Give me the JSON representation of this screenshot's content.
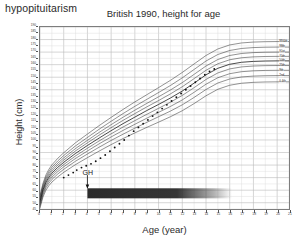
{
  "figure": {
    "corner_label": "hypopituitarism",
    "title": "British 1990, height for age"
  },
  "chart_data": {
    "type": "line",
    "title": "British 1990, height for age",
    "xlabel": "Age (year)",
    "ylabel": "Height (cm)",
    "xlim": [
      0,
      21
    ],
    "ylim": [
      45,
      190
    ],
    "grid": true,
    "legend_position": "right-inline-curve-labels",
    "xticks": [
      0,
      1,
      2,
      3,
      4,
      5,
      6,
      7,
      8,
      9,
      10,
      11,
      12,
      13,
      14,
      15,
      16,
      17,
      18,
      19,
      20,
      21
    ],
    "yticks": [
      45,
      50,
      55,
      60,
      65,
      70,
      75,
      80,
      85,
      90,
      95,
      100,
      105,
      110,
      115,
      120,
      125,
      130,
      135,
      140,
      145,
      150,
      155,
      160,
      165,
      170,
      175,
      180,
      185,
      190
    ],
    "ytick_labels": [
      "45",
      "50",
      "55",
      "60",
      "65",
      "70",
      "75",
      "80",
      "85",
      "90",
      "95",
      "100",
      "105",
      "110",
      "115",
      "120",
      "125",
      "130",
      "135",
      "140",
      "145",
      "150",
      "155",
      "160",
      "165",
      "170",
      "175",
      "180",
      "185",
      "190"
    ],
    "x": [
      0,
      0.25,
      0.5,
      0.75,
      1,
      1.5,
      2,
      3,
      4,
      5,
      6,
      7,
      8,
      9,
      10,
      11,
      12,
      13,
      14,
      15,
      16,
      17,
      18,
      19,
      20,
      21
    ],
    "series": [
      {
        "name": "0.4th",
        "label": "0.4th",
        "values": [
          45.8,
          54.5,
          60.0,
          63.6,
          66.4,
          70.6,
          74.2,
          80.4,
          85.9,
          91.2,
          96.3,
          101.1,
          105.6,
          110.0,
          114.2,
          118.5,
          123.3,
          129.0,
          135.2,
          140.4,
          143.6,
          145.2,
          145.9,
          146.2,
          146.3,
          146.3
        ]
      },
      {
        "name": "2nd",
        "label": "2nd",
        "values": [
          47.3,
          56.2,
          61.9,
          65.6,
          68.5,
          72.9,
          76.6,
          83.1,
          88.8,
          94.3,
          99.6,
          104.6,
          109.4,
          114.0,
          118.5,
          123.0,
          128.0,
          133.9,
          140.2,
          145.4,
          148.6,
          150.2,
          150.9,
          151.2,
          151.3,
          151.3
        ]
      },
      {
        "name": "9th",
        "label": "9th",
        "values": [
          48.6,
          57.7,
          63.5,
          67.3,
          70.3,
          74.8,
          78.6,
          85.3,
          91.2,
          97.0,
          102.4,
          107.6,
          112.5,
          117.3,
          122.0,
          126.7,
          131.9,
          138.0,
          144.4,
          149.6,
          152.8,
          154.4,
          155.1,
          155.4,
          155.5,
          155.5
        ]
      },
      {
        "name": "25th",
        "label": "25th",
        "values": [
          49.8,
          59.0,
          64.9,
          68.8,
          71.9,
          76.5,
          80.4,
          87.3,
          93.4,
          99.3,
          104.9,
          110.3,
          115.4,
          120.4,
          125.2,
          130.1,
          135.5,
          141.7,
          148.2,
          153.4,
          156.6,
          158.2,
          158.9,
          159.2,
          159.3,
          159.3
        ]
      },
      {
        "name": "50th",
        "label": "50th",
        "values": [
          51.0,
          60.2,
          66.3,
          70.3,
          73.5,
          78.2,
          82.2,
          89.3,
          95.6,
          101.6,
          107.4,
          113.0,
          118.2,
          123.4,
          128.3,
          133.4,
          139.0,
          145.3,
          151.9,
          157.1,
          160.3,
          161.9,
          162.6,
          162.9,
          163.0,
          163.0
        ]
      },
      {
        "name": "75th",
        "label": "75th",
        "values": [
          52.2,
          61.4,
          67.6,
          71.8,
          75.0,
          79.9,
          84.0,
          91.3,
          97.7,
          103.9,
          109.8,
          115.6,
          121.0,
          126.3,
          131.4,
          136.7,
          142.4,
          148.9,
          155.5,
          160.7,
          163.9,
          165.5,
          166.2,
          166.5,
          166.6,
          166.6
        ]
      },
      {
        "name": "91st",
        "label": "91st",
        "values": [
          53.3,
          62.6,
          68.9,
          73.2,
          76.5,
          81.5,
          85.7,
          93.2,
          99.7,
          106.1,
          112.2,
          118.1,
          123.7,
          129.1,
          134.4,
          139.8,
          145.7,
          152.3,
          158.9,
          164.1,
          167.3,
          168.9,
          169.6,
          169.9,
          170.0,
          170.0
        ]
      },
      {
        "name": "98th",
        "label": "98th",
        "values": [
          54.6,
          63.9,
          70.4,
          74.8,
          78.2,
          83.3,
          87.6,
          95.3,
          102.0,
          108.6,
          114.9,
          121.0,
          126.8,
          132.3,
          137.8,
          143.4,
          149.5,
          156.2,
          162.9,
          168.1,
          171.3,
          172.9,
          173.6,
          173.9,
          174.0,
          174.0
        ]
      },
      {
        "name": "99.6th",
        "label": "99.6th",
        "values": [
          56.0,
          65.4,
          72.1,
          76.6,
          80.1,
          85.4,
          89.8,
          97.8,
          104.7,
          111.5,
          118.0,
          124.3,
          130.3,
          136.0,
          141.7,
          147.5,
          153.8,
          160.6,
          167.3,
          172.5,
          175.7,
          177.3,
          178.0,
          178.3,
          178.4,
          178.4
        ]
      }
    ],
    "patient": {
      "name": "patient height measurements",
      "marker": "filled-circle",
      "x": [
        2.0,
        2.4,
        2.8,
        3.1,
        3.5,
        3.9,
        4.3,
        4.7,
        5.1,
        5.5,
        5.9,
        6.3,
        6.7,
        7.1,
        7.5,
        7.9,
        8.3,
        8.7,
        9.1,
        9.5,
        9.9,
        10.3,
        10.7,
        11.1,
        11.5,
        11.9,
        12.3,
        12.7,
        13.1,
        13.5,
        13.9,
        14.3,
        14.7
      ],
      "y": [
        70.0,
        72.0,
        74.0,
        76.0,
        78.0,
        79.5,
        81.0,
        83.0,
        85.5,
        88.0,
        91.0,
        94.0,
        97.0,
        100.0,
        103.5,
        107.0,
        110.0,
        113.0,
        116.0,
        119.0,
        122.0,
        125.0,
        128.0,
        131.0,
        134.0,
        137.0,
        140.0,
        143.0,
        146.0,
        149.0,
        152.0,
        154.5,
        156.5
      ]
    },
    "annotations": [
      {
        "name": "gh-treatment-start",
        "text": "GH",
        "x": 4.0,
        "arrow": "down"
      },
      {
        "name": "gh-treatment-bar",
        "text": "",
        "x_start": 4.0,
        "x_end": 16.2,
        "color": "#2b2b2b",
        "style": "horizontal-gradient-bar-fading-right"
      }
    ]
  }
}
